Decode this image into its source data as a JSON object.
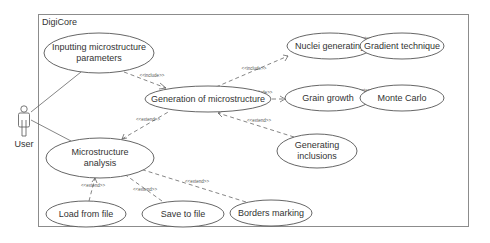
{
  "diagram": {
    "type": "uml-use-case",
    "system": {
      "name": "DigiCore"
    },
    "actor": {
      "name": "User"
    },
    "use_cases": [
      {
        "id": "inputting",
        "lines": [
          "Inputting microstructure",
          "parameters"
        ]
      },
      {
        "id": "generation",
        "lines": [
          "Generation of microstructure"
        ]
      },
      {
        "id": "nuclei",
        "lines": [
          "Nuclei generating"
        ]
      },
      {
        "id": "gradient",
        "lines": [
          "Gradient technique"
        ]
      },
      {
        "id": "grain",
        "lines": [
          "Grain growth"
        ]
      },
      {
        "id": "montecarlo",
        "lines": [
          "Monte Carlo"
        ]
      },
      {
        "id": "inclusions",
        "lines": [
          "Generating",
          "inclusions"
        ]
      },
      {
        "id": "analysis",
        "lines": [
          "Microstructure",
          "analysis"
        ]
      },
      {
        "id": "load",
        "lines": [
          "Load from file"
        ]
      },
      {
        "id": "save",
        "lines": [
          "Save to file"
        ]
      },
      {
        "id": "borders",
        "lines": [
          "Borders marking"
        ]
      }
    ],
    "relationships": [
      {
        "from": "User",
        "to": "inputting",
        "type": "association",
        "label": ""
      },
      {
        "from": "User",
        "to": "analysis",
        "type": "association",
        "label": ""
      },
      {
        "from": "inputting",
        "to": "generation",
        "type": "include",
        "label": "<<include>>"
      },
      {
        "from": "generation",
        "to": "nuclei",
        "type": "include",
        "label": "<<include>>"
      },
      {
        "from": "generation",
        "to": "grain",
        "type": "include",
        "label": "<<include>>"
      },
      {
        "from": "inclusions",
        "to": "generation",
        "type": "extend",
        "label": "<<extend>>"
      },
      {
        "from": "gradient",
        "to": "nuclei",
        "type": "extend",
        "label": "<<extend>>"
      },
      {
        "from": "montecarlo",
        "to": "grain",
        "type": "extend",
        "label": "<<extend>>"
      },
      {
        "from": "analysis",
        "to": "generation",
        "type": "extend",
        "label": "<<extend>>"
      },
      {
        "from": "load",
        "to": "analysis",
        "type": "extend",
        "label": "<<extend>>"
      },
      {
        "from": "save",
        "to": "analysis",
        "type": "extend",
        "label": "<<extend>>"
      },
      {
        "from": "borders",
        "to": "analysis",
        "type": "extend",
        "label": "<<extend>>"
      }
    ]
  }
}
